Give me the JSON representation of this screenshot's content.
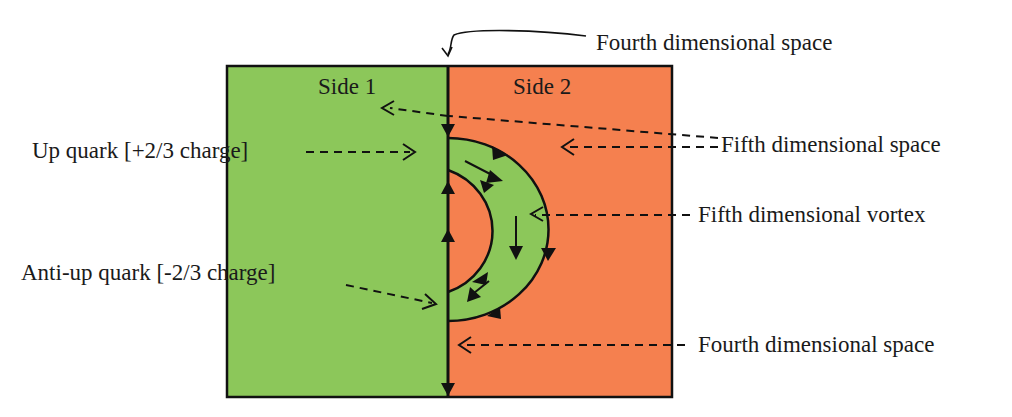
{
  "diagram": {
    "regions": {
      "side1": {
        "label": "Side 1",
        "color": "#8cc75a"
      },
      "side2": {
        "label": "Side 2",
        "color": "#f5804f"
      },
      "vortex_ring_color": "#8cc75a"
    },
    "labels": {
      "fourth_space_top": "Fourth dimensional space",
      "fifth_space": "Fifth dimensional space",
      "up_quark": "Up quark [+2/3 charge]",
      "fifth_vortex": "Fifth dimensional vortex",
      "anti_up_quark": "Anti-up quark [-2/3 charge]",
      "fourth_space_bottom": "Fourth dimensional space"
    },
    "colors": {
      "line": "#111111",
      "text": "#1a1a1a"
    }
  }
}
